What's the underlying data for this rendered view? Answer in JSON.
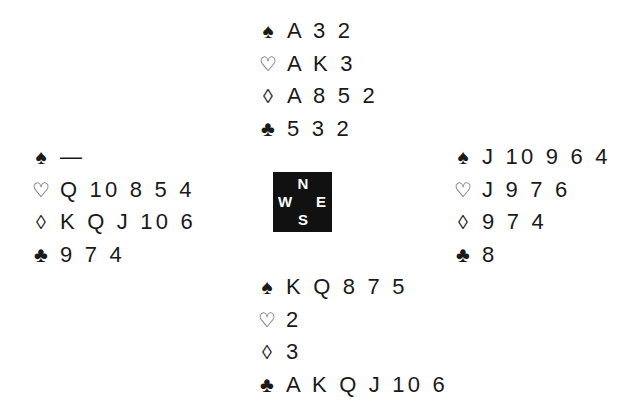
{
  "suit_glyphs": {
    "spades": "♠",
    "hearts": "♡",
    "diamonds": "◊",
    "clubs": "♣"
  },
  "compass": {
    "north": "N",
    "south": "S",
    "east": "E",
    "west": "W"
  },
  "hands": {
    "north": {
      "spades": "A 3 2",
      "hearts": "A K 3",
      "diamonds": "A 8 5 2",
      "clubs": "5 3 2"
    },
    "west": {
      "spades": "—",
      "hearts": "Q 10 8 5 4",
      "diamonds": "K Q J 10 6",
      "clubs": "9 7 4"
    },
    "east": {
      "spades": "J 10 9 6 4",
      "hearts": "J 9 7 6",
      "diamonds": "9 7 4",
      "clubs": "8"
    },
    "south": {
      "spades": "K Q 8 7 5",
      "hearts": "2",
      "diamonds": "3",
      "clubs": "A K Q J 10 6"
    }
  }
}
